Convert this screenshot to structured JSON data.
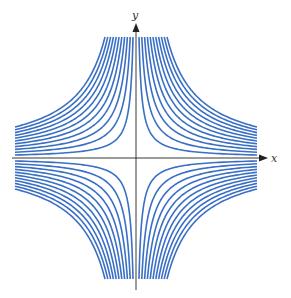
{
  "diagram": {
    "type": "family of hyperbolas xy = c",
    "axes": {
      "x_label": "x",
      "y_label": "y"
    },
    "curve_color": "#3a6fc4",
    "axis_color": "#222222",
    "curves_per_quadrant": 11,
    "quadrants": [
      "I",
      "II",
      "III",
      "IV"
    ]
  }
}
